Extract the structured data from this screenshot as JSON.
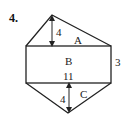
{
  "problem": {
    "number_label": "4."
  },
  "figure": {
    "shape": "composite hexagon: triangle A on top, rectangle B in middle, triangle C on bottom",
    "regions": {
      "A": "A",
      "B": "B",
      "C": "C"
    },
    "dimensions": {
      "top_height": "4",
      "rect_width": "11",
      "rect_height": "3",
      "bottom_height": "4"
    },
    "colors": {
      "stroke": "#222222",
      "background": "#ffffff"
    }
  }
}
